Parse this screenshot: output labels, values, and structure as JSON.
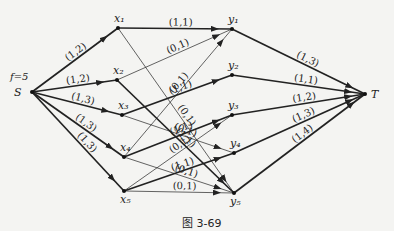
{
  "diagram": {
    "flow_label": "f=5",
    "caption": "图 3-69",
    "nodes": [
      {
        "id": "S",
        "label": "S",
        "x": 32,
        "y": 92
      },
      {
        "id": "x1",
        "label": "x₁",
        "x": 118,
        "y": 28
      },
      {
        "id": "x2",
        "label": "x₂",
        "x": 117,
        "y": 80
      },
      {
        "id": "x3",
        "label": "x₃",
        "x": 122,
        "y": 115
      },
      {
        "id": "x4",
        "label": "x₄",
        "x": 124,
        "y": 157
      },
      {
        "id": "x5",
        "label": "x₅",
        "x": 124,
        "y": 191
      },
      {
        "id": "y1",
        "label": "y₁",
        "x": 232,
        "y": 29
      },
      {
        "id": "y2",
        "label": "y₂",
        "x": 232,
        "y": 75
      },
      {
        "id": "y3",
        "label": "y₃",
        "x": 232,
        "y": 115
      },
      {
        "id": "y4",
        "label": "y₄",
        "x": 234,
        "y": 153
      },
      {
        "id": "y5",
        "label": "y₅",
        "x": 234,
        "y": 193
      },
      {
        "id": "T",
        "label": "T",
        "x": 365,
        "y": 94
      }
    ],
    "edges": [
      {
        "from": "S",
        "to": "x1",
        "label": "(1,2)",
        "bold": true
      },
      {
        "from": "S",
        "to": "x2",
        "label": "(1,2)",
        "bold": true
      },
      {
        "from": "S",
        "to": "x3",
        "label": "(1,3)",
        "bold": true
      },
      {
        "from": "S",
        "to": "x4",
        "label": "(1,3)",
        "bold": true
      },
      {
        "from": "S",
        "to": "x5",
        "label": "(1,3)",
        "bold": true
      },
      {
        "from": "x1",
        "to": "y1",
        "label": "(1,1)",
        "bold": true
      },
      {
        "from": "x1",
        "to": "y5",
        "label": "(0,1)",
        "bold": false
      },
      {
        "from": "x2",
        "to": "y1",
        "label": "(0,1)",
        "bold": false
      },
      {
        "from": "x2",
        "to": "y5",
        "label": "(1,1)",
        "bold": true
      },
      {
        "from": "x3",
        "to": "y2",
        "label": "(1,1)",
        "bold": true
      },
      {
        "from": "x3",
        "to": "y4",
        "label": "(0,1)",
        "bold": false
      },
      {
        "from": "x4",
        "to": "y1",
        "label": "(0,1)",
        "bold": false
      },
      {
        "from": "x4",
        "to": "y3",
        "label": "(1,1)",
        "bold": true
      },
      {
        "from": "x4",
        "to": "y5",
        "label": "(0,1)",
        "bold": false
      },
      {
        "from": "x5",
        "to": "y3",
        "label": "(0,1)",
        "bold": false
      },
      {
        "from": "x5",
        "to": "y4",
        "label": "(1,1)",
        "bold": true
      },
      {
        "from": "x5",
        "to": "y5",
        "label": "(0,1)",
        "bold": false
      },
      {
        "from": "y1",
        "to": "T",
        "label": "(1,3)",
        "bold": true
      },
      {
        "from": "y2",
        "to": "T",
        "label": "(1,1)",
        "bold": true
      },
      {
        "from": "y3",
        "to": "T",
        "label": "(1,2)",
        "bold": true
      },
      {
        "from": "y4",
        "to": "T",
        "label": "(1,3)",
        "bold": true
      },
      {
        "from": "y5",
        "to": "T",
        "label": "(1,4)",
        "bold": true
      }
    ]
  }
}
